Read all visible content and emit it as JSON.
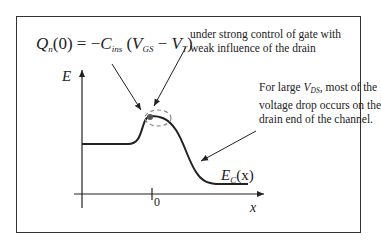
{
  "diagram": {
    "title_formula": {
      "lhs_symbol": "Q",
      "lhs_sub": "n",
      "lhs_arg": "(0)",
      "equals": " = −",
      "c_symbol": "C",
      "c_sub": "ins",
      "open": " (",
      "v1": "V",
      "v1_sub": "GS",
      "minus": " − ",
      "v2": "V",
      "v2_sub": "T",
      "close": ")"
    },
    "annotations": {
      "gate_control_line1": "under strong control of gate with",
      "gate_control_line2": "weak influence of the drain",
      "drain_drop_prefix": "For large ",
      "drain_drop_var": "V",
      "drain_drop_var_sub": "DS",
      "drain_drop_line1_suffix": ", most of the",
      "drain_drop_line2": "voltage drop occurs on the",
      "drain_drop_line3": "drain end of the channel."
    },
    "axes": {
      "y_label": "E",
      "x_label": "x",
      "x_tick_label": "0"
    },
    "curve_label": {
      "symbol": "E",
      "sub": "C",
      "arg": "(x)"
    },
    "colors": {
      "line": "#222222",
      "dashed_ellipse": "#888888",
      "dot": "#555555",
      "frame": "#333333"
    }
  }
}
